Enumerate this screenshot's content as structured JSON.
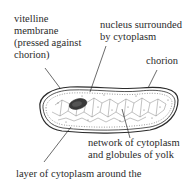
{
  "diagram": {
    "labels": {
      "vitelline_line1": "vitelline",
      "vitelline_line2": "membrane",
      "vitelline_line3": "(pressed against",
      "vitelline_line4": "chorion)",
      "nucleus_line1": "nucleus surrounded",
      "nucleus_line2": "by cytoplasm",
      "chorion": "chorion",
      "network_line1": "network of cytoplasm",
      "network_line2": "and globules of yolk",
      "layer_line1": "layer of cytoplasm around the"
    },
    "colors": {
      "ink": "#2b2b2b",
      "background": "#ffffff",
      "nucleus": "#3a3a3a"
    }
  }
}
